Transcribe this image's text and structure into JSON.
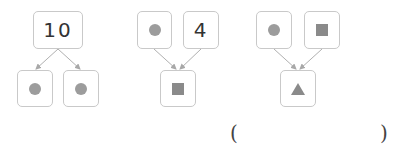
{
  "diagrams": [
    {
      "top": [
        {
          "type": "number",
          "value": "10"
        }
      ],
      "bottom": [
        {
          "type": "shape",
          "shape": "circle"
        },
        {
          "type": "shape",
          "shape": "circle"
        }
      ],
      "direction": "split"
    },
    {
      "top": [
        {
          "type": "shape",
          "shape": "circle"
        },
        {
          "type": "number",
          "value": "4"
        }
      ],
      "bottom": [
        {
          "type": "shape",
          "shape": "square"
        }
      ],
      "direction": "combine"
    },
    {
      "top": [
        {
          "type": "shape",
          "shape": "circle"
        },
        {
          "type": "shape",
          "shape": "square"
        }
      ],
      "bottom": [
        {
          "type": "shape",
          "shape": "triangle"
        }
      ],
      "direction": "combine"
    }
  ],
  "answer": {
    "open": "(",
    "close": ")",
    "value": ""
  },
  "colors": {
    "border": "#c9c9c9",
    "shape": "#8a8a8a",
    "line": "#b0b0b0"
  }
}
